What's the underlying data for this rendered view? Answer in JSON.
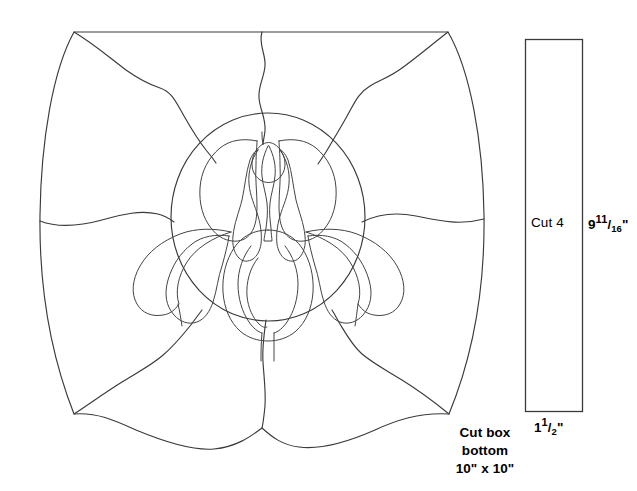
{
  "document": {
    "title": "Iris stained glass box pattern",
    "type": "line-art-pattern",
    "background_color": "#ffffff",
    "line_color": "#3a3a3a"
  },
  "annotations": {
    "box_bottom": {
      "line1": "Cut box",
      "line2": "bottom",
      "line3": "10\" x 10\""
    },
    "side_panel": {
      "cut_label": "Cut 4",
      "height_whole": "9",
      "height_num": "11",
      "height_den": "16",
      "height_unit": "\"",
      "width_whole": "1",
      "width_num": "1",
      "width_den": "2",
      "width_unit": "\""
    }
  },
  "shapes": {
    "main_panel_name": "box-bottom-pattern",
    "side_strip_name": "box-side-strip",
    "center_motif_name": "iris-flower-medallion"
  }
}
